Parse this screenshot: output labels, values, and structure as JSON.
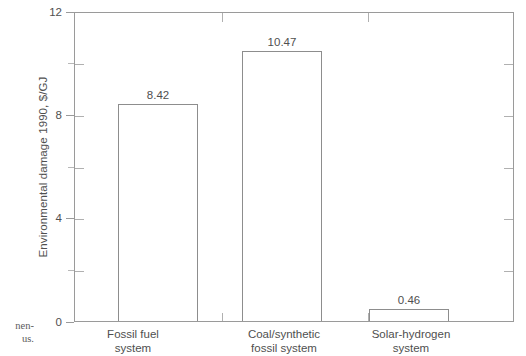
{
  "chart_data": {
    "type": "bar",
    "title": "",
    "xlabel": "",
    "ylabel": "Environmental damage 1990, $/GJ",
    "ylim": [
      0,
      12
    ],
    "yticks": [
      0,
      4,
      8,
      12
    ],
    "ytick_labels": [
      "0",
      "4",
      "8",
      "12"
    ],
    "yminor_ticks": [
      2,
      6,
      10
    ],
    "grid": false,
    "legend": null,
    "categories": [
      "Fossil fuel system",
      "Coal/synthetic fossil system",
      "Solar-hydrogen system"
    ],
    "category_lines": [
      [
        "Fossil fuel",
        "system"
      ],
      [
        "Coal/synthetic",
        "fossil system"
      ],
      [
        "Solar-hydrogen",
        "system"
      ]
    ],
    "values": [
      8.42,
      10.47,
      0.46
    ],
    "value_labels": [
      "8.42",
      "10.47",
      "0.46"
    ],
    "bar_style": {
      "fill": "#ffffff",
      "edge": "#8d8d8d"
    },
    "axis_color": "#9a9a9a",
    "text_color": "#4f4f4f"
  },
  "caption_fragment": {
    "line1": "nen-",
    "line2": "us."
  }
}
